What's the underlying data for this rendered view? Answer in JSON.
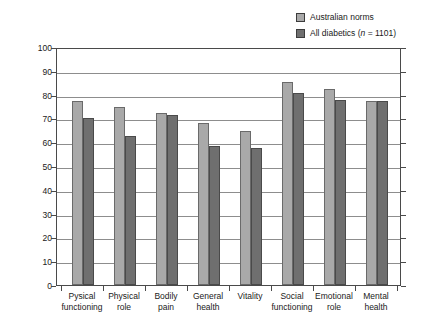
{
  "chart_data": {
    "type": "bar",
    "title": "",
    "subtitle": "",
    "xlabel": "",
    "ylabel": "Mean QOL scores",
    "ylim": [
      0,
      100
    ],
    "ytick_step": 10,
    "yticks": [
      "100",
      "90",
      "80",
      "70",
      "60",
      "50",
      "40",
      "30",
      "20",
      "10",
      "0"
    ],
    "grid": "horizontal",
    "legend_position": "top-right",
    "categories": [
      "Pysical functioning",
      "Physical role",
      "Bodily pain",
      "General health",
      "Vitality",
      "Social functioning",
      "Emotional role",
      "Mental health"
    ],
    "category_lines": [
      [
        "Pysical",
        "functioning"
      ],
      [
        "Physical",
        "role"
      ],
      [
        "Bodily",
        "pain"
      ],
      [
        "General",
        "health"
      ],
      [
        "Vitality",
        ""
      ],
      [
        "Social",
        "functioning"
      ],
      [
        "Emotional",
        "role"
      ],
      [
        "Mental",
        "health"
      ]
    ],
    "series": [
      {
        "name": "Australian norms",
        "color": "#a9a9a9",
        "values": [
          77.2,
          74.9,
          72.3,
          68.0,
          64.8,
          85.5,
          82.4,
          77.3
        ]
      },
      {
        "name": "All diabetics (n = 1101)",
        "color": "#6f6f6f",
        "values": [
          70.1,
          62.7,
          71.3,
          58.3,
          57.4,
          80.8,
          77.8,
          77.3
        ]
      }
    ]
  },
  "legend": {
    "items": [
      {
        "label": "Australian norms",
        "label_prefix": "Australian norms",
        "label_italic": "",
        "label_suffix": "",
        "color": "#a9a9a9"
      },
      {
        "label": "All diabetics (n = 1101)",
        "label_prefix": "All diabetics (",
        "label_italic": "n",
        "label_suffix": " = 1101)",
        "color": "#6f6f6f"
      }
    ]
  },
  "axis": {
    "y_title": "Mean QOL scores"
  }
}
